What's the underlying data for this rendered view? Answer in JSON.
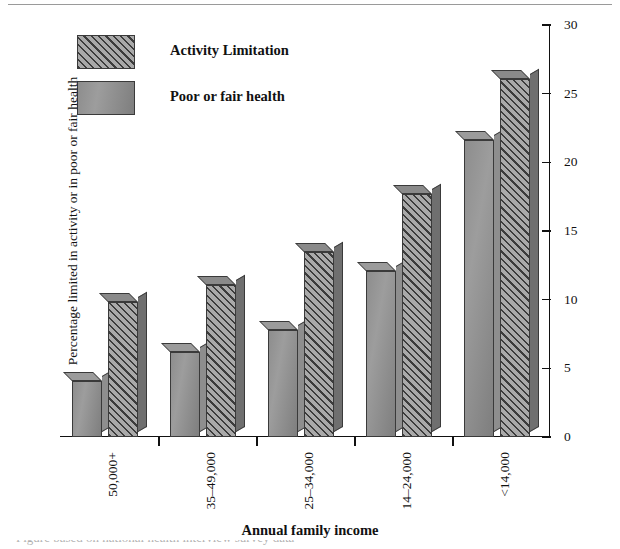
{
  "chart_data": {
    "type": "bar",
    "title": "",
    "xlabel": "Annual family income",
    "ylabel": "Percentage limited in activity or in poor or fair health",
    "categories": [
      "50,000+",
      "35–49,000",
      "25–34,000",
      "14–24,000",
      "<14,000"
    ],
    "series": [
      {
        "name": "Poor or fair health",
        "values": [
          4.1,
          6.2,
          7.8,
          12.1,
          21.6
        ],
        "pattern": "solid"
      },
      {
        "name": "Activity Limitation",
        "values": [
          9.8,
          11.1,
          13.5,
          17.7,
          26.1
        ],
        "pattern": "hatched"
      }
    ],
    "series_order_in_group": [
      "Poor or fair health",
      "Activity Limitation"
    ],
    "ylim": [
      0,
      30
    ],
    "yticks": [
      0,
      5,
      10,
      15,
      20,
      25,
      30
    ],
    "ytick_labels": [
      "0",
      "5",
      "10",
      "15",
      "20",
      "25",
      "30"
    ],
    "yaxis_position": "right",
    "grid": false,
    "legend_position": "top-left",
    "bar_style": "3d"
  },
  "legend": {
    "items": [
      {
        "label": "Activity Limitation",
        "pattern": "hatched"
      },
      {
        "label": "Poor or fair health",
        "pattern": "solid"
      }
    ]
  },
  "colors": {
    "hatch_line": "#3c3c3c",
    "hatch_background": "#a9a9a9",
    "solid_fill": "#919191",
    "bar_outline": "#3a3a3a",
    "axis": "#111111",
    "background": "#ffffff"
  },
  "footer": {
    "clipped_text": "Figure based on national health interview survey data"
  }
}
